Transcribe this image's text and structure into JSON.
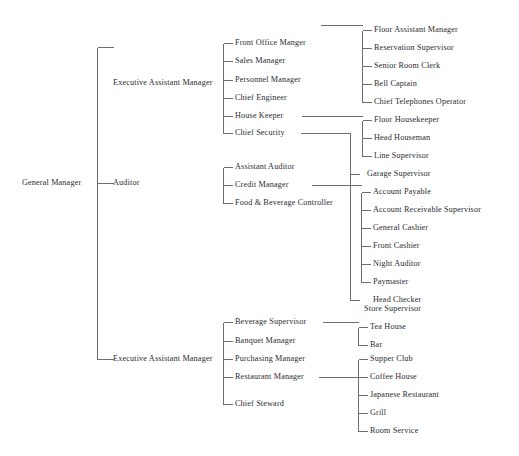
{
  "chart_title": "Hotel Organizational Chart",
  "colors": {
    "background": "#ffffff",
    "text": "#2b2b30",
    "connector": "#6b6f73"
  },
  "nodes": {
    "general_manager": "General Manager",
    "executive_assistant_manager_top": "Executive Assistant Manager",
    "auditor": "Auditor",
    "executive_assistant_manager_bottom": "Executive Assistant Manager",
    "front_office_manger": "Front Office Manger",
    "sales_manager": "Sales Manager",
    "personnel_manager": "Personnel Manager",
    "chief_engineer": "Chief Engineer",
    "house_keeper": "House Keeper",
    "chief_security": "Chief Security",
    "assistant_auditor": "Assistant Auditor",
    "credit_manager": "Credit Manager",
    "food_beverage_controller": "Food & Beverage Controller",
    "beverage_supervisor": "Beverage Supervisor",
    "banquet_manager": "Banquet Manager",
    "purchasing_manager": "Purchasing Manager",
    "restaurant_manager": "Restaurant Manager",
    "chief_steward": "Chief Steward",
    "floor_assistant_manager": "Floor Assistant Manager",
    "reservation_supervisor": "Reservation Supervisor",
    "senior_room_clerk": "Senior Room Clerk",
    "bell_captain": "Bell Captain",
    "chief_telephones_operator": "Chief Telephones Operator",
    "floor_housekeeper": "Floor Housekeeper",
    "head_houseman": "Head Houseman",
    "line_supervisor": "Line Supervisor",
    "garage_supervisor": "Garage Supervisor",
    "account_payable": "Account Payable",
    "account_receivable_supervisor": "Account Receivable Supervisor",
    "general_cashier": "General Cashier",
    "front_cashier": "Front Cashier",
    "night_auditor": "Night Auditor",
    "paymaster": "Paymaster",
    "head_checker": "Head Checker",
    "store_supervisor": "Store Supervisor",
    "tea_house": "Tea House",
    "bar": "Bar",
    "supper_club": "Supper Club",
    "coffee_house": "Coffee House",
    "japanese_restaurant": "Japanese Restaurant",
    "grill": "Grill",
    "room_service": "Room Service"
  },
  "chart_data": {
    "type": "diagram",
    "diagram_kind": "organizational-tree",
    "orientation": "left-to-right",
    "levels": 4,
    "root": {
      "label": "General Manager",
      "children": [
        {
          "label": "Executive Assistant Manager",
          "children": [
            {
              "label": "Front Office Manger",
              "children": [
                {
                  "label": "Floor Assistant Manager"
                },
                {
                  "label": "Reservation Supervisor"
                },
                {
                  "label": "Senior Room Clerk"
                },
                {
                  "label": "Bell Captain"
                },
                {
                  "label": "Chief Telephones Operator"
                }
              ]
            },
            {
              "label": "Sales Manager"
            },
            {
              "label": "Personnel Manager"
            },
            {
              "label": "Chief Engineer"
            },
            {
              "label": "House Keeper",
              "children": [
                {
                  "label": "Floor Housekeeper"
                },
                {
                  "label": "Head Houseman"
                },
                {
                  "label": "Line Supervisor"
                }
              ]
            },
            {
              "label": "Chief Security",
              "children": [
                {
                  "label": "Garage Supervisor"
                },
                {
                  "label": "Store Supervisor"
                }
              ]
            }
          ]
        },
        {
          "label": "Auditor",
          "children": [
            {
              "label": "Assistant Auditor"
            },
            {
              "label": "Credit Manager",
              "children": [
                {
                  "label": "Account Payable"
                },
                {
                  "label": "Account Receivable Supervisor"
                },
                {
                  "label": "General Cashier"
                },
                {
                  "label": "Front Cashier"
                },
                {
                  "label": "Night Auditor"
                },
                {
                  "label": "Paymaster"
                },
                {
                  "label": "Head Checker"
                }
              ]
            },
            {
              "label": "Food & Beverage Controller"
            }
          ]
        },
        {
          "label": "Executive Assistant Manager",
          "children": [
            {
              "label": "Beverage Supervisor",
              "children": [
                {
                  "label": "Tea House"
                },
                {
                  "label": "Bar"
                }
              ]
            },
            {
              "label": "Banquet Manager"
            },
            {
              "label": "Purchasing Manager"
            },
            {
              "label": "Restaurant Manager",
              "children": [
                {
                  "label": "Supper Club"
                },
                {
                  "label": "Coffee House"
                },
                {
                  "label": "Japanese Restaurant"
                },
                {
                  "label": "Grill"
                },
                {
                  "label": "Room Service"
                }
              ]
            },
            {
              "label": "Chief Steward"
            }
          ]
        }
      ]
    }
  },
  "geometry": {
    "width": 519,
    "height": 456,
    "lines": [
      [
        97,
        47,
        97,
        359
      ],
      [
        97,
        47,
        113,
        47
      ],
      [
        97,
        183,
        113,
        183
      ],
      [
        97,
        359,
        113,
        359
      ],
      [
        223,
        43,
        223,
        133
      ],
      [
        223,
        43,
        232,
        43
      ],
      [
        223,
        61,
        232,
        61
      ],
      [
        223,
        80,
        232,
        80
      ],
      [
        223,
        98,
        232,
        98
      ],
      [
        223,
        116,
        232,
        116
      ],
      [
        223,
        133,
        232,
        133
      ],
      [
        223,
        167,
        223,
        203
      ],
      [
        223,
        167,
        232,
        167
      ],
      [
        223,
        185,
        232,
        185
      ],
      [
        223,
        203,
        232,
        203
      ],
      [
        223,
        322,
        223,
        404
      ],
      [
        223,
        322,
        232,
        322
      ],
      [
        223,
        341,
        232,
        341
      ],
      [
        223,
        359,
        232,
        359
      ],
      [
        223,
        377,
        232,
        377
      ],
      [
        223,
        404,
        232,
        404
      ],
      [
        320,
        25,
        362,
        25
      ],
      [
        362,
        30,
        362,
        102
      ],
      [
        362,
        30,
        371,
        30
      ],
      [
        362,
        48,
        371,
        48
      ],
      [
        362,
        66,
        371,
        66
      ],
      [
        362,
        84,
        371,
        84
      ],
      [
        362,
        102,
        371,
        102
      ],
      [
        301,
        116,
        362,
        116
      ],
      [
        362,
        120,
        362,
        156
      ],
      [
        362,
        120,
        371,
        120
      ],
      [
        362,
        138,
        371,
        138
      ],
      [
        362,
        156,
        371,
        156
      ],
      [
        300,
        133,
        350,
        133
      ],
      [
        350,
        133,
        350,
        300
      ],
      [
        350,
        174,
        359,
        174
      ],
      [
        350,
        300,
        359,
        300
      ],
      [
        311,
        185,
        361,
        185
      ],
      [
        361,
        192,
        361,
        282
      ],
      [
        361,
        192,
        370,
        192
      ],
      [
        361,
        210,
        370,
        210
      ],
      [
        361,
        228,
        370,
        228
      ],
      [
        361,
        246,
        370,
        246
      ],
      [
        361,
        264,
        370,
        264
      ],
      [
        361,
        282,
        370,
        282
      ],
      [
        361,
        192,
        361,
        192
      ],
      [
        322,
        322,
        358,
        322
      ],
      [
        358,
        327,
        358,
        345
      ],
      [
        358,
        327,
        367,
        327
      ],
      [
        358,
        345,
        367,
        345
      ],
      [
        318,
        377,
        358,
        377
      ],
      [
        358,
        359,
        358,
        431
      ],
      [
        358,
        359,
        367,
        359
      ],
      [
        358,
        377,
        367,
        377
      ],
      [
        358,
        395,
        367,
        395
      ],
      [
        358,
        413,
        367,
        413
      ],
      [
        358,
        431,
        367,
        431
      ]
    ]
  },
  "positions": {
    "general_manager": [
      22,
      183
    ],
    "executive_assistant_manager_top": [
      113,
      83
    ],
    "auditor": [
      113,
      183
    ],
    "executive_assistant_manager_bottom": [
      113,
      359
    ],
    "front_office_manger": [
      235,
      43
    ],
    "sales_manager": [
      235,
      61
    ],
    "personnel_manager": [
      235,
      80
    ],
    "chief_engineer": [
      235,
      98
    ],
    "house_keeper": [
      235,
      116
    ],
    "chief_security": [
      235,
      133
    ],
    "assistant_auditor": [
      235,
      167
    ],
    "credit_manager": [
      235,
      185
    ],
    "food_beverage_controller": [
      235,
      203
    ],
    "beverage_supervisor": [
      235,
      322
    ],
    "banquet_manager": [
      235,
      341
    ],
    "purchasing_manager": [
      235,
      359
    ],
    "restaurant_manager": [
      235,
      377
    ],
    "chief_steward": [
      235,
      404
    ],
    "floor_assistant_manager": [
      374,
      30
    ],
    "reservation_supervisor": [
      374,
      48
    ],
    "senior_room_clerk": [
      374,
      66
    ],
    "bell_captain": [
      374,
      84
    ],
    "chief_telephones_operator": [
      374,
      102
    ],
    "floor_housekeeper": [
      374,
      120
    ],
    "head_houseman": [
      374,
      138
    ],
    "line_supervisor": [
      374,
      156
    ],
    "garage_supervisor": [
      367,
      174
    ],
    "account_payable": [
      373,
      192
    ],
    "account_receivable_supervisor": [
      373,
      210
    ],
    "general_cashier": [
      373,
      228
    ],
    "front_cashier": [
      373,
      246
    ],
    "night_auditor": [
      373,
      264
    ],
    "paymaster": [
      373,
      282
    ],
    "head_checker": [
      373,
      300
    ],
    "store_supervisor": [
      364,
      309
    ],
    "tea_house": [
      370,
      327
    ],
    "bar": [
      370,
      345
    ],
    "supper_club": [
      370,
      359
    ],
    "coffee_house": [
      370,
      377
    ],
    "japanese_restaurant": [
      370,
      395
    ],
    "grill": [
      370,
      413
    ],
    "room_service": [
      370,
      431
    ]
  }
}
